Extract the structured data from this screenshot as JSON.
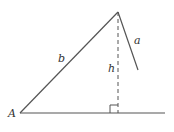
{
  "diagram": {
    "labels": {
      "vertex_a": "A",
      "side_b": "b",
      "side_a": "a",
      "height": "h"
    },
    "colors": {
      "stroke": "#555555",
      "text": "#333333"
    }
  }
}
